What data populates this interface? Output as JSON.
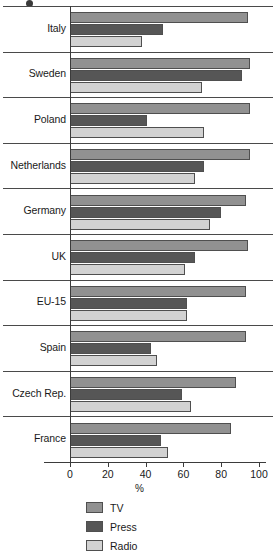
{
  "chart_data": {
    "type": "bar",
    "orientation": "horizontal",
    "title": "",
    "subtitle": "",
    "xlabel": "%",
    "ylabel": "",
    "xlim": [
      0,
      100
    ],
    "xticks": [
      0,
      20,
      40,
      60,
      80,
      100
    ],
    "xtick_labels": [
      "0",
      "20",
      "40",
      "60",
      "80",
      "100"
    ],
    "grid": false,
    "legend_position": "bottom-left",
    "categories": [
      "Italy",
      "Sweden",
      "Poland",
      "Netherlands",
      "Germany",
      "UK",
      "EU-15",
      "Spain",
      "Czech Rep.",
      "France"
    ],
    "series": [
      {
        "name": "TV",
        "color": "#919191",
        "values": [
          94,
          95,
          95,
          95,
          93,
          94,
          93,
          93,
          88,
          85
        ]
      },
      {
        "name": "Press",
        "color": "#565656",
        "values": [
          49,
          91,
          41,
          71,
          80,
          66,
          62,
          43,
          59,
          48
        ]
      },
      {
        "name": "Radio",
        "color": "#d2d2d2",
        "values": [
          38,
          70,
          71,
          66,
          74,
          61,
          62,
          46,
          64,
          52
        ]
      }
    ]
  },
  "legend": {
    "items": [
      {
        "label": "TV",
        "color": "#919191",
        "swatch": "tv"
      },
      {
        "label": "Press",
        "color": "#565656",
        "swatch": "press"
      },
      {
        "label": "Radio",
        "color": "#d2d2d2",
        "swatch": "radio"
      }
    ]
  },
  "axis": {
    "x_title": "%"
  }
}
